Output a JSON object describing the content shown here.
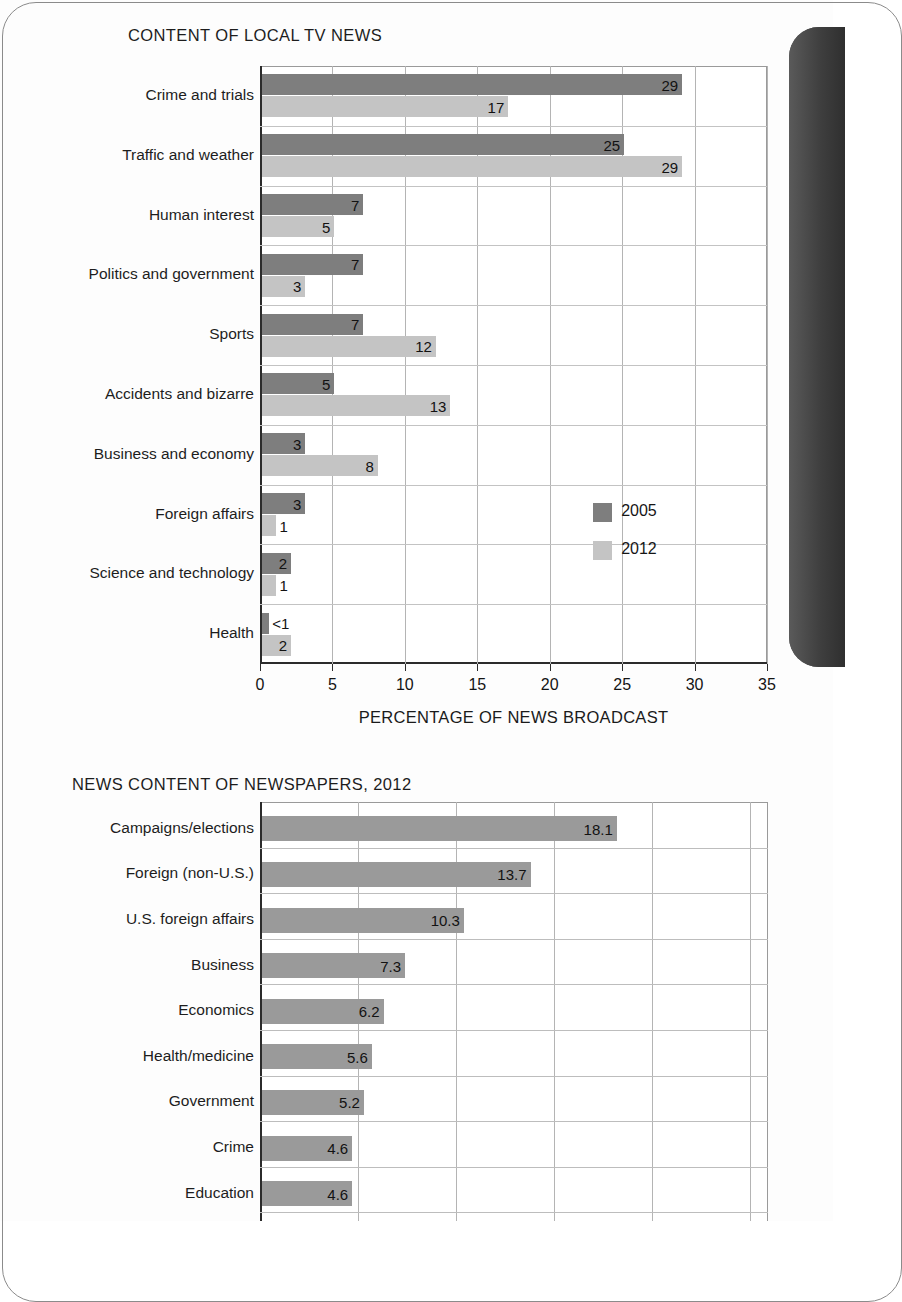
{
  "page": {
    "background_color": "#fdfdfd",
    "spine_color": "#3f3f3f"
  },
  "colors": {
    "series_2005": "#7e7e7e",
    "series_2012": "#c4c4c4",
    "bar_single": "#9a9a9a",
    "grid": "#b4b4b4",
    "axis": "#2b2b2b",
    "text": "#1a1a1a"
  },
  "chart_data": [
    {
      "type": "bar",
      "orientation": "horizontal",
      "grouped": true,
      "title": "CONTENT OF LOCAL TV NEWS",
      "xlabel": "PERCENTAGE OF NEWS BROADCAST",
      "ylabel": "",
      "xlim": [
        0,
        35
      ],
      "xticks": [
        0,
        5,
        10,
        15,
        20,
        25,
        30,
        35
      ],
      "grid": true,
      "legend_position": "inside-right",
      "categories": [
        "Crime and trials",
        "Traffic and weather",
        "Human interest",
        "Politics and government",
        "Sports",
        "Accidents and bizarre",
        "Business and economy",
        "Foreign affairs",
        "Science and technology",
        "Health"
      ],
      "series": [
        {
          "name": "2005",
          "color": "#7e7e7e",
          "values": [
            29,
            25,
            7,
            7,
            7,
            5,
            3,
            3,
            2,
            0.5
          ],
          "labels": [
            "29",
            "25",
            "7",
            "7",
            "7",
            "5",
            "3",
            "3",
            "2",
            "<1"
          ]
        },
        {
          "name": "2012",
          "color": "#c4c4c4",
          "values": [
            17,
            29,
            5,
            3,
            12,
            13,
            8,
            1,
            1,
            2
          ],
          "labels": [
            "17",
            "29",
            "5",
            "3",
            "12",
            "13",
            "8",
            "1",
            "1",
            "2"
          ]
        }
      ]
    },
    {
      "type": "bar",
      "orientation": "horizontal",
      "grouped": false,
      "title": "NEWS CONTENT OF NEWSPAPERS, 2012",
      "xlabel": "",
      "ylabel": "",
      "xlim": [
        0,
        26
      ],
      "xticks": [],
      "grid": true,
      "legend_position": "none",
      "categories": [
        "Campaigns/elections",
        "Foreign (non-U.S.)",
        "U.S. foreign affairs",
        "Business",
        "Economics",
        "Health/medicine",
        "Government",
        "Crime",
        "Education"
      ],
      "series": [
        {
          "name": "2012",
          "color": "#9a9a9a",
          "values": [
            18.1,
            13.7,
            10.3,
            7.3,
            6.2,
            5.6,
            5.2,
            4.6,
            4.6
          ],
          "labels": [
            "18.1",
            "13.7",
            "10.3",
            "7.3",
            "6.2",
            "5.6",
            "5.2",
            "4.6",
            "4.6"
          ]
        }
      ]
    }
  ],
  "chart1": {
    "title": "CONTENT OF LOCAL TV NEWS",
    "axis_title": "PERCENTAGE OF NEWS BROADCAST",
    "ticks": [
      "0",
      "5",
      "10",
      "15",
      "20",
      "25",
      "30",
      "35"
    ],
    "legend": [
      {
        "label": "2005",
        "color": "#7e7e7e"
      },
      {
        "label": "2012",
        "color": "#c4c4c4"
      }
    ],
    "rows": [
      {
        "label": "Crime and trials",
        "v2005": 29,
        "l2005": "29",
        "v2012": 17,
        "l2012": "17"
      },
      {
        "label": "Traffic and weather",
        "v2005": 25,
        "l2005": "25",
        "v2012": 29,
        "l2012": "29"
      },
      {
        "label": "Human interest",
        "v2005": 7,
        "l2005": "7",
        "v2012": 5,
        "l2012": "5"
      },
      {
        "label": "Politics and government",
        "v2005": 7,
        "l2005": "7",
        "v2012": 3,
        "l2012": "3"
      },
      {
        "label": "Sports",
        "v2005": 7,
        "l2005": "7",
        "v2012": 12,
        "l2012": "12"
      },
      {
        "label": "Accidents and bizarre",
        "v2005": 5,
        "l2005": "5",
        "v2012": 13,
        "l2012": "13"
      },
      {
        "label": "Business and economy",
        "v2005": 3,
        "l2005": "3",
        "v2012": 8,
        "l2012": "8"
      },
      {
        "label": "Foreign affairs",
        "v2005": 3,
        "l2005": "3",
        "v2012": 1,
        "l2012": "1"
      },
      {
        "label": "Science and technology",
        "v2005": 2,
        "l2005": "2",
        "v2012": 1,
        "l2012": "1"
      },
      {
        "label": "Health",
        "v2005": 0.5,
        "l2005": "<1",
        "v2012": 2,
        "l2012": "2"
      }
    ]
  },
  "chart2": {
    "title": "NEWS CONTENT OF NEWSPAPERS, 2012",
    "rows": [
      {
        "label": "Campaigns/elections",
        "value": 18.1,
        "vlabel": "18.1"
      },
      {
        "label": "Foreign (non-U.S.)",
        "value": 13.7,
        "vlabel": "13.7"
      },
      {
        "label": "U.S. foreign affairs",
        "value": 10.3,
        "vlabel": "10.3"
      },
      {
        "label": "Business",
        "value": 7.3,
        "vlabel": "7.3"
      },
      {
        "label": "Economics",
        "value": 6.2,
        "vlabel": "6.2"
      },
      {
        "label": "Health/medicine",
        "value": 5.6,
        "vlabel": "5.6"
      },
      {
        "label": "Government",
        "value": 5.2,
        "vlabel": "5.2"
      },
      {
        "label": "Crime",
        "value": 4.6,
        "vlabel": "4.6"
      },
      {
        "label": "Education",
        "value": 4.6,
        "vlabel": "4.6"
      }
    ]
  }
}
